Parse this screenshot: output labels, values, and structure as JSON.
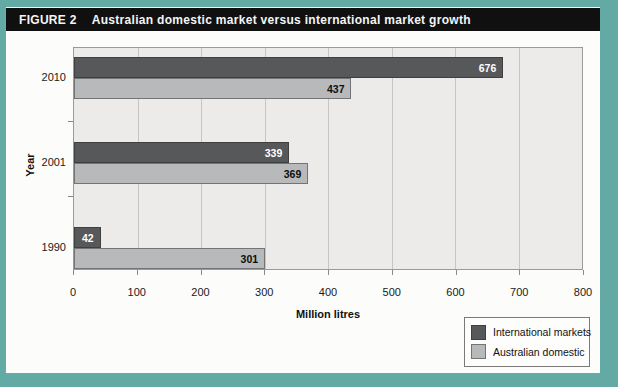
{
  "figure": {
    "label": "FIGURE 2",
    "title": "Australian domestic market versus international market growth"
  },
  "chart_data": {
    "type": "bar",
    "orientation": "horizontal",
    "title": "Australian domestic market versus international market growth",
    "categories": [
      "2010",
      "2001",
      "1990"
    ],
    "series": [
      {
        "name": "International markets",
        "color": "#57585a",
        "values": [
          676,
          339,
          42
        ]
      },
      {
        "name": "Australian domestic",
        "color": "#b8b9bb",
        "values": [
          437,
          369,
          301
        ]
      }
    ],
    "xlabel": "Million litres",
    "ylabel": "Year",
    "xlim": [
      0,
      800
    ],
    "xticks": [
      0,
      100,
      200,
      300,
      400,
      500,
      600,
      700,
      800
    ],
    "grid": true,
    "value_labels": true,
    "legend_position": "bottom-right"
  },
  "colors": {
    "page_frame": "#63aaa4",
    "panel_background": "#fcfcfb",
    "title_bar_background": "#101010",
    "title_bar_text": "#f5f5f5",
    "plot_background": "#edebe9",
    "gridline": "#c7c5c3",
    "series_international": "#57585a",
    "series_domestic": "#b8b9bb"
  }
}
